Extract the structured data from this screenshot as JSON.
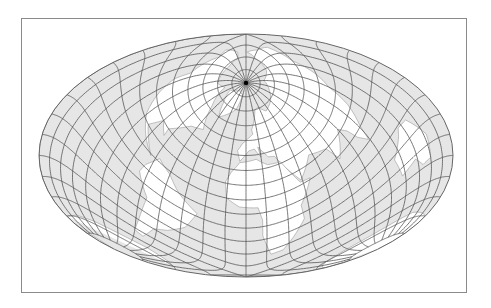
{
  "figure": {
    "type": "map",
    "projection": "oblique Hammer-Aitoff (equal-area ellipse), pole displaced to upper center",
    "frame": {
      "x": 21,
      "y": 18,
      "width": 446,
      "height": 275,
      "stroke": "#8a8a8a"
    },
    "ellipse": {
      "cx": 246,
      "cy": 155.5,
      "rx": 207,
      "ry": 121.5
    },
    "pole_screen_position": {
      "x": 245,
      "y": 90
    },
    "graticule": {
      "meridian_step_deg": 15,
      "parallel_step_deg": 10,
      "stroke": "#555555",
      "width": 0.8
    },
    "colors": {
      "ocean": "#e6e6e6",
      "land": "#ffffff",
      "coastline": "#9a9a9a",
      "outline": "#666666",
      "pole_marker": "#000000",
      "background": "#ffffff"
    },
    "oblique_pole": {
      "lat": 50,
      "lon": 0
    }
  },
  "map_data": {
    "graticule_lines": "meridians every 15 degrees converging at visible north pole; parallels every 10 degrees",
    "land_masses": [
      "North America",
      "South America",
      "Europe",
      "Africa",
      "Asia",
      "Australia",
      "Greenland",
      "Antarctica (edge)"
    ]
  }
}
